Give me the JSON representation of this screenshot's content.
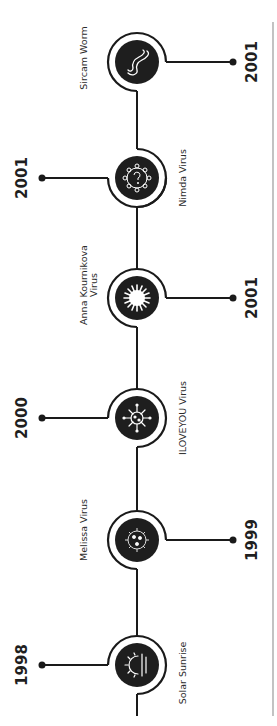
{
  "timeline": {
    "orientation": "rotated-90-ccw",
    "colors": {
      "line": "#1a1a1a",
      "node_fill": "#1e1e1e",
      "icon_stroke": "#ffffff",
      "border": "#9a9a9a",
      "text": "#2b2b2b"
    },
    "events": [
      {
        "name": "Sircam Worm",
        "year": "2001",
        "icon": "worm-icon",
        "year_side": "right",
        "label_side": "left"
      },
      {
        "name": "Nimda Virus",
        "year": "2001",
        "icon": "virus-question-icon",
        "year_side": "left",
        "label_side": "right"
      },
      {
        "name_line1": "Anna Kournikova",
        "name_line2": "Virus",
        "name": "Anna Kournikova Virus",
        "year": "2001",
        "icon": "starburst-icon",
        "year_side": "right",
        "label_side": "left"
      },
      {
        "name": "ILOVEYOU Virus",
        "year": "2000",
        "icon": "virus-icon",
        "year_side": "left",
        "label_side": "right"
      },
      {
        "name": "Melissa Virus",
        "year": "1999",
        "icon": "gear-virus-icon",
        "year_side": "right",
        "label_side": "left"
      },
      {
        "name": "Solar Sunrise",
        "year": "1998",
        "icon": "sunrise-icon",
        "year_side": "left",
        "label_side": "right"
      }
    ]
  }
}
